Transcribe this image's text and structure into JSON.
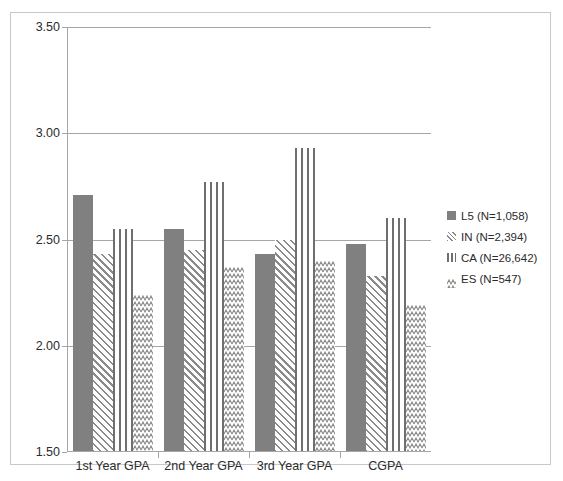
{
  "chart_data": {
    "type": "bar",
    "title": "",
    "xlabel": "",
    "ylabel": "",
    "ylim": [
      1.5,
      3.5
    ],
    "ytick_step": 0.5,
    "yticks": [
      "3.50",
      "3.00",
      "2.50",
      "2.00",
      "1.50"
    ],
    "ytick_values": [
      3.5,
      3.0,
      2.5,
      2.0,
      1.5
    ],
    "grid": true,
    "legend_position": "right",
    "categories": [
      "1st Year GPA",
      "2nd Year GPA",
      "3rd Year GPA",
      "CGPA"
    ],
    "series": [
      {
        "name": "L5 (N=1,058)",
        "key": "L5",
        "pattern": "solid",
        "values": [
          2.71,
          2.55,
          2.43,
          2.48
        ]
      },
      {
        "name": "IN (N=2,394)",
        "key": "IN",
        "pattern": "diagonal-hatch",
        "values": [
          2.43,
          2.45,
          2.5,
          2.33
        ]
      },
      {
        "name": "CA (N=26,642)",
        "key": "CA",
        "pattern": "vertical-stripes",
        "values": [
          2.55,
          2.77,
          2.93,
          2.6
        ]
      },
      {
        "name": "ES (N=547)",
        "key": "ES",
        "pattern": "wave-hatch",
        "values": [
          2.24,
          2.37,
          2.4,
          2.19
        ]
      }
    ]
  },
  "legend": {
    "items": [
      {
        "label": "L5 (N=1,058)"
      },
      {
        "label": "IN (N=2,394)"
      },
      {
        "label": "CA (N=26,642)"
      },
      {
        "label": "ES (N=547)"
      }
    ]
  },
  "colors": {
    "solid_fill": "#808080",
    "hatch_stroke": "#8a8a8a",
    "stripe_stroke": "#6f6f6f",
    "gridline": "#a6a6a6",
    "border": "#c8c8c8",
    "text": "#2b2b2b",
    "background": "#ffffff"
  }
}
